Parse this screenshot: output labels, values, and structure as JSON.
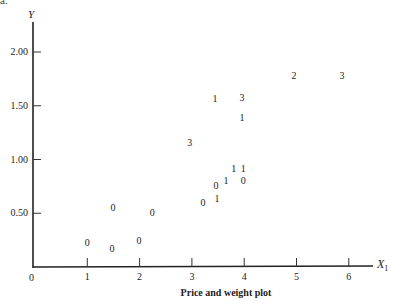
{
  "figure": {
    "corner_label": "a.",
    "caption": "Price and weight plot",
    "y_axis_label": "Y",
    "x_axis_label": "X",
    "x_axis_label_sub": "1",
    "origin_label": "0"
  },
  "axes": {
    "y_ticks": [
      {
        "label": "2.00",
        "value": 2.0
      },
      {
        "label": "1.50",
        "value": 1.5
      },
      {
        "label": "1.00",
        "value": 1.0
      },
      {
        "label": "0.50",
        "value": 0.5
      }
    ],
    "x_ticks": [
      {
        "label": "1",
        "value": 1
      },
      {
        "label": "2",
        "value": 2
      },
      {
        "label": "3",
        "value": 3
      },
      {
        "label": "4",
        "value": 4
      },
      {
        "label": "5",
        "value": 5
      },
      {
        "label": "6",
        "value": 6
      }
    ]
  },
  "chart_data": {
    "type": "scatter",
    "title": "Price and weight plot",
    "xlabel": "X1",
    "ylabel": "Y",
    "xlim": [
      0,
      6.5
    ],
    "ylim": [
      0,
      2.2
    ],
    "grid": false,
    "legend": null,
    "marker": "points plotted as digit labels (category codes)",
    "points": [
      {
        "x": 1.0,
        "y": 0.22,
        "label": "0"
      },
      {
        "x": 1.47,
        "y": 0.17,
        "label": "0"
      },
      {
        "x": 1.99,
        "y": 0.24,
        "label": "0"
      },
      {
        "x": 1.49,
        "y": 0.55,
        "label": "0"
      },
      {
        "x": 2.24,
        "y": 0.5,
        "label": "0"
      },
      {
        "x": 3.21,
        "y": 0.6,
        "label": "0"
      },
      {
        "x": 3.48,
        "y": 0.63,
        "label": "1"
      },
      {
        "x": 3.46,
        "y": 0.75,
        "label": "0"
      },
      {
        "x": 3.65,
        "y": 0.8,
        "label": "1"
      },
      {
        "x": 3.98,
        "y": 0.8,
        "label": "0"
      },
      {
        "x": 3.8,
        "y": 0.91,
        "label": "1"
      },
      {
        "x": 3.98,
        "y": 0.91,
        "label": "1"
      },
      {
        "x": 2.96,
        "y": 1.15,
        "label": "3"
      },
      {
        "x": 3.44,
        "y": 1.56,
        "label": "1"
      },
      {
        "x": 3.96,
        "y": 1.57,
        "label": "3"
      },
      {
        "x": 3.96,
        "y": 1.39,
        "label": "1"
      },
      {
        "x": 4.95,
        "y": 1.78,
        "label": "2"
      },
      {
        "x": 5.87,
        "y": 1.78,
        "label": "3"
      }
    ]
  }
}
